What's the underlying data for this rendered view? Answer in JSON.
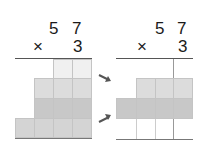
{
  "left_problem": {
    "multiplicand_tens": "5",
    "multiplicand_ones": "7",
    "operator": "×",
    "multiplier": "3"
  },
  "right_problem": {
    "multiplicand_tens": "5",
    "multiplicand_ones": "7",
    "operator": "×",
    "multiplier": "3"
  },
  "colors": {
    "very_light": "#f0f0f0",
    "light": "#dcdcdc",
    "dark": "#c8c8c8",
    "medium": "#d4d4d4",
    "arrow": "#555555"
  }
}
